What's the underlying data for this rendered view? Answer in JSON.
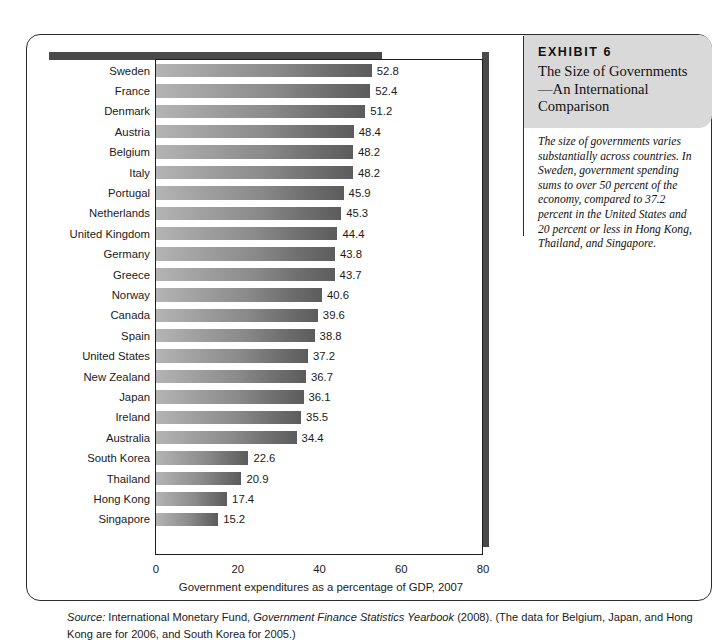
{
  "exhibit": {
    "number_label": "EXHIBIT 6",
    "title": "The Size of Governments—An International Comparison",
    "caption": "The size of governments varies substantially across countries. In Sweden, government spending sums to over 50 percent of the economy, compared to 37.2 percent in the United States and 20 percent or less in Hong Kong, Thailand, and Singapore."
  },
  "source_note": {
    "label": "Source:",
    "text_1": " International Monetary Fund, ",
    "italic_1": "Government Finance Statistics Yearbook",
    "text_2": " (2008). (The data for Belgium, Japan, and Hong Kong are for 2006, and South Korea for 2005.)"
  },
  "chart_data": {
    "type": "bar",
    "orientation": "horizontal",
    "title": "The Size of Governments—An International Comparison",
    "xlabel": "Government expenditures as a percentage of GDP, 2007",
    "ylabel": "",
    "xlim": [
      0,
      80
    ],
    "xticks": [
      0,
      20,
      40,
      60,
      80
    ],
    "xticklabels": [
      "0",
      "20",
      "40",
      "60",
      "80"
    ],
    "grid": false,
    "legend": false,
    "bar_color_light": "#b4b4b4",
    "bar_color_dark": "#5c5c5c",
    "categories": [
      "Sweden",
      "France",
      "Denmark",
      "Austria",
      "Belgium",
      "Italy",
      "Portugal",
      "Netherlands",
      "United Kingdom",
      "Germany",
      "Greece",
      "Norway",
      "Canada",
      "Spain",
      "United States",
      "New Zealand",
      "Japan",
      "Ireland",
      "Australia",
      "South Korea",
      "Thailand",
      "Hong Kong",
      "Singapore"
    ],
    "values": [
      52.8,
      52.4,
      51.2,
      48.4,
      48.2,
      48.2,
      45.9,
      45.3,
      44.4,
      43.8,
      43.7,
      40.6,
      39.6,
      38.8,
      37.2,
      36.7,
      36.1,
      35.5,
      34.4,
      22.6,
      20.9,
      17.4,
      15.2
    ],
    "value_labels": [
      "52.8",
      "52.4",
      "51.2",
      "48.4",
      "48.2",
      "48.2",
      "45.9",
      "45.3",
      "44.4",
      "43.8",
      "43.7",
      "40.6",
      "39.6",
      "38.8",
      "37.2",
      "36.7",
      "36.1",
      "35.5",
      "34.4",
      "22.6",
      "20.9",
      "17.4",
      "15.2"
    ]
  }
}
